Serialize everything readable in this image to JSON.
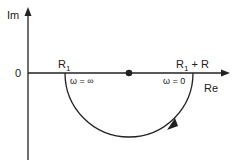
{
  "diagram": {
    "axes": {
      "y_label": "Im",
      "x_label": "Re",
      "origin_label": "0"
    },
    "points": {
      "left_intercept": "R",
      "left_intercept_sub": "1",
      "right_intercept_a": "R",
      "right_intercept_sub": "1",
      "right_intercept_b": " + R"
    },
    "annotations": {
      "left_omega": "ω = ∞",
      "right_omega": "ω = 0"
    },
    "colors": {
      "line": "#222222"
    }
  }
}
